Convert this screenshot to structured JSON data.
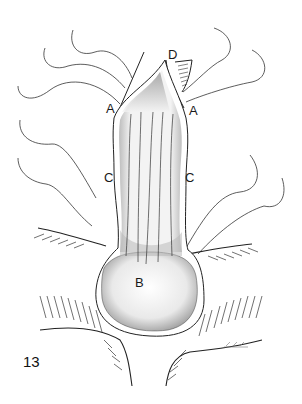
{
  "figure": {
    "number": "13",
    "signature": "L.E.C.",
    "labels": {
      "A_left": "A",
      "A_right": "A",
      "B": "B",
      "C_left": "C",
      "C_right": "C",
      "D": "D"
    },
    "colors": {
      "line": "#222222",
      "stipple": "#555555",
      "background": "#ffffff"
    }
  }
}
